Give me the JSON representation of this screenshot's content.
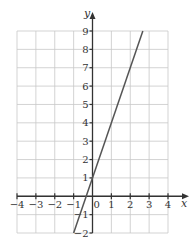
{
  "chart_data": {
    "type": "line",
    "title": "",
    "xlabel": "x",
    "ylabel": "y",
    "xlim": [
      -4,
      4
    ],
    "ylim": [
      -2,
      9
    ],
    "grid": true,
    "x_ticks": [
      "−4",
      "−3",
      "−2",
      "−1",
      "0",
      "1",
      "2",
      "3",
      "4"
    ],
    "y_ticks": [
      "−2",
      "−1",
      "1",
      "2",
      "3",
      "4",
      "5",
      "6",
      "7",
      "8",
      "9"
    ],
    "series": [
      {
        "name": "y = 3x + 1",
        "equation": "y = 3x + 1",
        "x": [
          -1,
          2.667
        ],
        "y": [
          -2,
          9
        ]
      }
    ],
    "colors": {
      "grid": "#c8c8c8",
      "axis": "#333333",
      "line": "#555555"
    }
  }
}
